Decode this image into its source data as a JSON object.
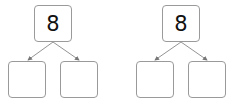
{
  "diagrams": [
    {
      "top_value": "8",
      "bottom_left_value": "",
      "bottom_right_value": ""
    },
    {
      "top_value": "8",
      "bottom_left_value": "",
      "bottom_right_value": ""
    }
  ],
  "colors": {
    "box_border": "#9a9a9a",
    "arrow": "#777777",
    "text": "#111111"
  }
}
